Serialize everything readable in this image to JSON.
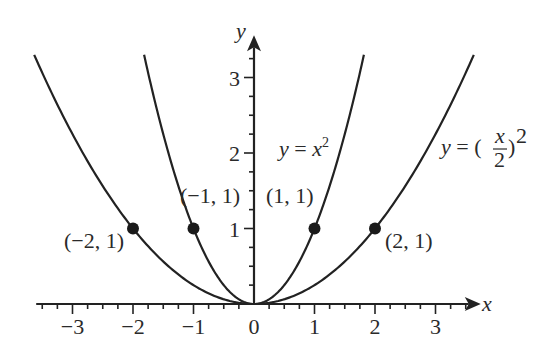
{
  "chart_data": {
    "type": "line",
    "title": "",
    "xlabel": "x",
    "ylabel": "y",
    "xlim": [
      -3.6,
      3.6
    ],
    "ylim": [
      0,
      3.4
    ],
    "x_ticks": [
      -3,
      -2,
      -1,
      0,
      1,
      2,
      3
    ],
    "x_tick_labels": [
      "−3",
      "−2",
      "−1",
      "0",
      "1",
      "2",
      "3"
    ],
    "y_ticks": [
      1,
      2,
      3
    ],
    "y_tick_labels": [
      "1",
      "2",
      "3"
    ],
    "minor_tick_step": 0.25,
    "grid": false,
    "series": [
      {
        "name": "y = x²",
        "function": "x^2",
        "color": "#222222"
      },
      {
        "name": "y = (x/2)²",
        "function": "(x/2)^2",
        "color": "#222222"
      }
    ],
    "points": [
      {
        "x": -2,
        "y": 1,
        "label": "(−2, 1)"
      },
      {
        "x": -1,
        "y": 1,
        "label": "(−1, 1)"
      },
      {
        "x": 1,
        "y": 1,
        "label": "(1, 1)"
      },
      {
        "x": 2,
        "y": 1,
        "label": "(2, 1)"
      }
    ],
    "annotations": [
      "y = x²",
      "y = (x/2)²"
    ]
  },
  "axes": {
    "x_name": "x",
    "y_name": "y",
    "origin_label": "0"
  },
  "labels": {
    "eq1_lhs": "y",
    "eq1_mid": " = ",
    "eq1_var": "x",
    "eq1_exp": "2",
    "eq2_lhs": "y",
    "eq2_mid": " = (",
    "eq2_num": "x",
    "eq2_den": "2",
    "eq2_close": ")",
    "eq2_exp": "2"
  }
}
